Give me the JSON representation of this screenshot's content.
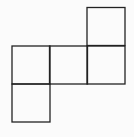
{
  "diagram": {
    "type": "net-of-squares",
    "stroke_color": "#222222",
    "background_color": "#fbfbfb",
    "cell_size": 38,
    "squares": [
      {
        "id": "top-right",
        "col": 2,
        "row": 0
      },
      {
        "id": "middle-left",
        "col": 0,
        "row": 1
      },
      {
        "id": "middle-center",
        "col": 1,
        "row": 1
      },
      {
        "id": "middle-right",
        "col": 2,
        "row": 1
      },
      {
        "id": "bottom-left",
        "col": 0,
        "row": 2
      }
    ]
  }
}
